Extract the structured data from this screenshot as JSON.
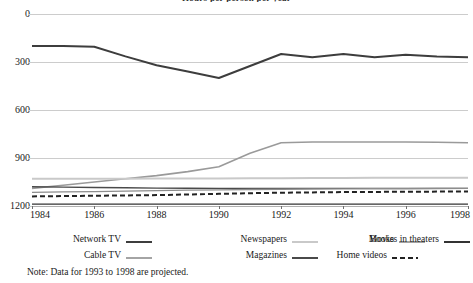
{
  "chart_data": {
    "type": "line",
    "title": "Hours per person per year",
    "xlabel": "",
    "ylabel": "",
    "x": [
      1984,
      1985,
      1986,
      1987,
      1988,
      1989,
      1990,
      1991,
      1992,
      1993,
      1994,
      1995,
      1996,
      1997,
      1998
    ],
    "xlim": [
      1984,
      1998
    ],
    "ylim": [
      0,
      1200
    ],
    "yticks": [
      0,
      300,
      600,
      900,
      1200
    ],
    "xticks": [
      1984,
      1986,
      1988,
      1990,
      1992,
      1994,
      1996,
      1998
    ],
    "grid": true,
    "legend_position": "bottom",
    "note": "Note: Data for 1993 to 1998 are projected.",
    "series": [
      {
        "name": "Network TV",
        "color": "#3d3d3d",
        "width": 2.0,
        "dash": "none",
        "values": [
          1000,
          1000,
          995,
          935,
          880,
          840,
          800,
          875,
          950,
          930,
          950,
          930,
          945,
          935,
          930
        ]
      },
      {
        "name": "Cable TV",
        "color": "#9a9a9a",
        "width": 1.6,
        "dash": "none",
        "values": [
          110,
          130,
          150,
          170,
          190,
          215,
          245,
          330,
          395,
          400,
          400,
          400,
          400,
          398,
          395
        ]
      },
      {
        "name": "Newspapers",
        "color": "#c9c9c9",
        "width": 2.0,
        "dash": "none",
        "values": [
          170,
          170,
          170,
          170,
          172,
          172,
          172,
          173,
          174,
          175,
          175,
          176,
          176,
          177,
          177
        ]
      },
      {
        "name": "Magazines",
        "color": "#4a4a4a",
        "width": 1.4,
        "dash": "none",
        "values": [
          120,
          118,
          116,
          114,
          112,
          111,
          110,
          110,
          110,
          110,
          110,
          110,
          110,
          110,
          110
        ]
      },
      {
        "name": "Books",
        "color": "#8d8d8d",
        "width": 1.4,
        "dash": "none",
        "values": [
          85,
          88,
          90,
          93,
          96,
          99,
          101,
          103,
          105,
          106,
          107,
          108,
          108,
          109,
          110
        ]
      },
      {
        "name": "Home videos",
        "color": "#222222",
        "width": 2.0,
        "dash": "5,3",
        "values": [
          60,
          62,
          64,
          66,
          68,
          72,
          76,
          80,
          83,
          85,
          87,
          88,
          89,
          90,
          90
        ]
      },
      {
        "name": "Movies in theaters",
        "color": "#333333",
        "width": 1.4,
        "dash": "none",
        "values": [
          12,
          12,
          12,
          12,
          12,
          12,
          12,
          12,
          12,
          12,
          12,
          12,
          12,
          12,
          12
        ]
      }
    ]
  },
  "y_axis": {
    "ticks": [
      "1200",
      "900",
      "600",
      "300",
      "0"
    ]
  },
  "x_axis": {
    "ticks": [
      "1984",
      "1986",
      "1988",
      "1990",
      "1992",
      "1994",
      "1996",
      "1998"
    ]
  },
  "legend": {
    "items": [
      {
        "label": "Network TV",
        "color": "#3d3d3d",
        "width": 2.0,
        "dash": "none"
      },
      {
        "label": "Newspapers",
        "color": "#c9c9c9",
        "width": 2.0,
        "dash": "none"
      },
      {
        "label": "Books",
        "color": "#8d8d8d",
        "width": 1.6,
        "dash": "none"
      },
      {
        "label": "Movies in theaters",
        "color": "#333333",
        "width": 2.0,
        "dash": "none"
      },
      {
        "label": "Cable TV",
        "color": "#9a9a9a",
        "width": 1.8,
        "dash": "none"
      },
      {
        "label": "Magazines",
        "color": "#4a4a4a",
        "width": 2.0,
        "dash": "none"
      },
      {
        "label": "Home videos",
        "color": "#222222",
        "width": 2.2,
        "dash": "5,3"
      }
    ]
  },
  "note": {
    "text": "Note: Data for 1993 to 1998 are projected."
  },
  "title": {
    "text": "Hours per person per year"
  }
}
